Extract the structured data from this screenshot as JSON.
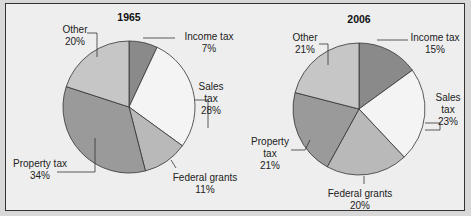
{
  "chart_data": [
    {
      "type": "pie",
      "title": "1965",
      "categories": [
        "Income tax",
        "Sales tax",
        "Federal grants",
        "Property tax",
        "Other"
      ],
      "values": [
        7,
        28,
        11,
        34,
        20
      ],
      "unit": "%"
    },
    {
      "type": "pie",
      "title": "2006",
      "categories": [
        "Income tax",
        "Sales tax",
        "Federal grants",
        "Property tax",
        "Other"
      ],
      "values": [
        15,
        23,
        20,
        21,
        21
      ],
      "unit": "%"
    }
  ],
  "colors": {
    "income_tax": "#8a8a8a",
    "sales_tax": "#f4f4f4",
    "federal_grants": "#b9b9b9",
    "property_tax": "#9a9a9a",
    "other": "#c6c6c6",
    "frame_bg": "#eeeeee"
  },
  "labels": {
    "chart1": {
      "title": "1965",
      "income": [
        "Income tax",
        "7%"
      ],
      "sales": [
        "Sales",
        "tax",
        "28%"
      ],
      "federal": [
        "Federal grants",
        "11%"
      ],
      "property": [
        "Property tax",
        "34%"
      ],
      "other": [
        "Other",
        "20%"
      ]
    },
    "chart2": {
      "title": "2006",
      "income": [
        "Income tax",
        "15%"
      ],
      "sales": [
        "Sales",
        "tax",
        "23%"
      ],
      "federal": [
        "Federal grants",
        "20%"
      ],
      "property": [
        "Property",
        "tax",
        "21%"
      ],
      "other": [
        "Other",
        "21%"
      ]
    }
  }
}
